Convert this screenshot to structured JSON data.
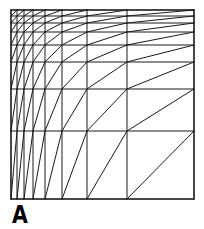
{
  "figure": {
    "panel_label": "A",
    "type": "log-grid-diagonal-nomograph",
    "background_color": "#ffffff",
    "line_color": "#1a1a1a",
    "line_width": 1.0,
    "border_color": "#1a1a1a",
    "border_width": 1.2
  },
  "chart_data": {
    "type": "line",
    "title": "",
    "subtitle": "",
    "xlabel": "",
    "ylabel": "",
    "grid": true,
    "legend_position": "none",
    "annotations": [
      "A"
    ],
    "plot_box": {
      "left": 11,
      "top": 10,
      "right": 194,
      "bottom": 199,
      "width": 183,
      "height": 189
    },
    "x_scale": "log",
    "y_scale": "log-reversed",
    "x_tick_labels": [],
    "y_tick_labels": [],
    "xlim": [
      1,
      9
    ],
    "ylim": [
      1,
      9
    ],
    "n_columns": 8,
    "n_rows": 8,
    "vertical_gridlines_x": [
      11,
      17,
      24,
      33,
      45,
      62,
      87,
      127,
      194
    ],
    "horizontal_gridlines_y": [
      10,
      16,
      23,
      32,
      45,
      62,
      89,
      131,
      199
    ],
    "cell_diagonal": {
      "from": "bottom-left",
      "to": "top-right",
      "every_cell": true,
      "count": 64
    },
    "series": [
      {
        "name": "vertical gridlines",
        "values": [
          11,
          17,
          24,
          33,
          45,
          62,
          87,
          127,
          194
        ]
      },
      {
        "name": "horizontal gridlines",
        "values": [
          10,
          16,
          23,
          32,
          45,
          62,
          89,
          131,
          199
        ]
      }
    ]
  }
}
